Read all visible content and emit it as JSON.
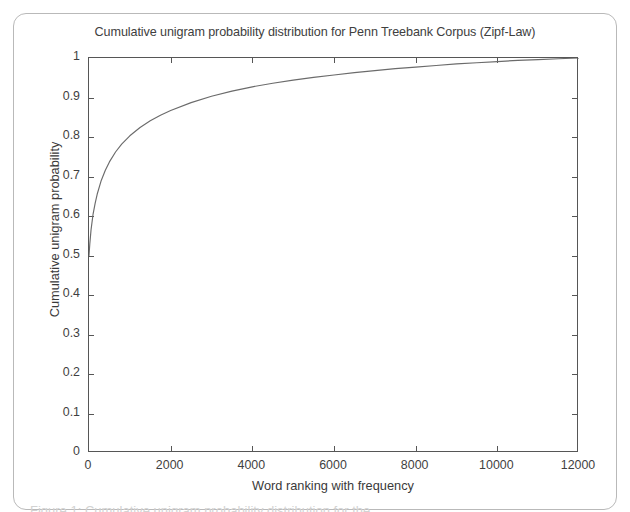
{
  "figure": {
    "title": "Cumulative unigram probability distribution for Penn Treebank Corpus (Zipf-Law)",
    "caption_remnant": "Figure 1: Cumulative unigram probability distribution for the"
  },
  "chart_data": {
    "type": "line",
    "title": "Cumulative unigram probability distribution for Penn Treebank Corpus (Zipf-Law)",
    "xlabel": "Word ranking with frequency",
    "ylabel": "Cumulative unigram probability",
    "xlim": [
      0,
      12000
    ],
    "ylim": [
      0,
      1
    ],
    "xticks": [
      0,
      2000,
      4000,
      6000,
      8000,
      10000,
      12000
    ],
    "xtick_labels": [
      "0",
      "2000",
      "4000",
      "6000",
      "8000",
      "10000",
      "12000"
    ],
    "yticks": [
      0,
      0.1,
      0.2,
      0.3,
      0.4,
      0.5,
      0.6,
      0.7,
      0.8,
      0.9,
      1
    ],
    "ytick_labels": [
      "0",
      "0.1",
      "0.2",
      "0.3",
      "0.4",
      "0.5",
      "0.6",
      "0.7",
      "0.8",
      "0.9",
      "1"
    ],
    "grid": false,
    "legend": null,
    "line_color": "#6b6b6b",
    "series": [
      {
        "name": "Cumulative unigram probability",
        "x": [
          0,
          20,
          50,
          100,
          150,
          200,
          300,
          400,
          500,
          650,
          800,
          1000,
          1250,
          1500,
          1750,
          2000,
          2500,
          3000,
          3500,
          4000,
          4500,
          5000,
          5500,
          6000,
          6500,
          7000,
          7500,
          8000,
          8500,
          9000,
          9500,
          10000,
          10500,
          11000,
          11500,
          12000
        ],
        "y": [
          0.5,
          0.53,
          0.565,
          0.605,
          0.632,
          0.655,
          0.69,
          0.716,
          0.737,
          0.762,
          0.782,
          0.803,
          0.824,
          0.841,
          0.855,
          0.867,
          0.887,
          0.903,
          0.916,
          0.927,
          0.936,
          0.944,
          0.951,
          0.957,
          0.963,
          0.968,
          0.973,
          0.977,
          0.981,
          0.985,
          0.988,
          0.991,
          0.994,
          0.996,
          0.998,
          1.0
        ]
      }
    ]
  }
}
